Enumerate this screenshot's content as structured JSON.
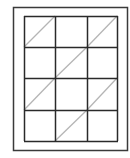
{
  "diagram": {
    "colors": {
      "background": "#ffffff",
      "frame": "#3a3a3a",
      "grid": "#2a2a2a",
      "diagonal": "#b5b5b5"
    },
    "outer_frame": {
      "x": 13,
      "y": 7,
      "w": 115,
      "h": 144
    },
    "grid": {
      "x": 24,
      "y": 16,
      "cols": 3,
      "rows": 4,
      "col_lines": [
        24,
        55,
        87,
        117
      ],
      "row_lines": [
        16,
        47,
        78,
        110,
        141
      ]
    },
    "diagonal_cells": [
      [
        0,
        0
      ],
      [
        0,
        2
      ],
      [
        1,
        1
      ],
      [
        2,
        0
      ],
      [
        2,
        2
      ],
      [
        3,
        1
      ]
    ]
  }
}
